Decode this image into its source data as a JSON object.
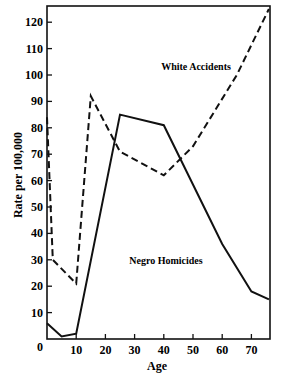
{
  "chart_data": {
    "type": "line",
    "title": "",
    "xlabel": "Age",
    "ylabel": "Rate per 100,000",
    "xlim": [
      0,
      76
    ],
    "ylim": [
      0,
      126
    ],
    "grid": false,
    "legend": "inline labels",
    "x_ticks": [
      0,
      10,
      20,
      30,
      40,
      50,
      60,
      70
    ],
    "y_ticks": [
      10,
      20,
      30,
      40,
      50,
      60,
      70,
      80,
      90,
      100,
      110,
      120
    ],
    "series": [
      {
        "name": "White Accidents",
        "style": "dashed",
        "x": [
          0,
          2,
          10,
          15,
          25,
          40,
          50,
          65,
          76
        ],
        "values": [
          84,
          30,
          21,
          92,
          71,
          62,
          73,
          100,
          125
        ]
      },
      {
        "name": "Negro Homicides",
        "style": "solid",
        "x": [
          0,
          5,
          10,
          25,
          40,
          60,
          70,
          76
        ],
        "values": [
          6,
          1,
          2,
          85,
          81,
          36,
          18,
          15
        ]
      }
    ],
    "annotations": [
      {
        "text": "White Accidents",
        "x": 57,
        "y": 103
      },
      {
        "text": "Negro Homicides",
        "x": 45,
        "y": 40
      }
    ]
  },
  "labels": {
    "xlabel": "Age",
    "ylabel": "Rate per 100,000",
    "origin": "0",
    "white": "White Accidents",
    "negro": "Negro Homicides"
  }
}
